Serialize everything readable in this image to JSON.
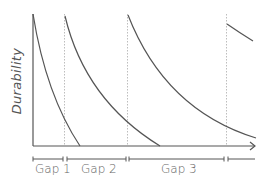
{
  "diagram": {
    "y_axis_label": "Durability",
    "x_axis_arrow": true,
    "gaps": [
      {
        "label": "Gap 1"
      },
      {
        "label": "Gap 2"
      },
      {
        "label": "Gap 3"
      }
    ],
    "colors": {
      "curve": "#555555",
      "axis": "#555555",
      "dotted_line": "#bbbbbb",
      "text": "#666666"
    }
  }
}
